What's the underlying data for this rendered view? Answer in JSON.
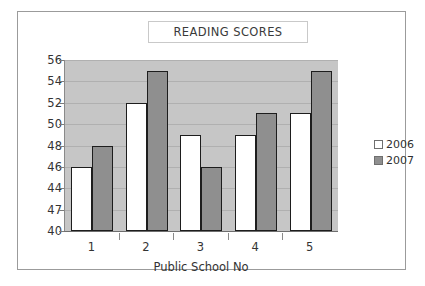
{
  "chart_data": {
    "type": "bar",
    "title": "READING SCORES",
    "xlabel": "Public School No",
    "ylabel": "",
    "categories": [
      "1",
      "2",
      "3",
      "4",
      "5"
    ],
    "series": [
      {
        "name": "2006",
        "values": [
          46,
          52,
          49,
          49,
          51
        ],
        "color": "#ffffff"
      },
      {
        "name": "2007",
        "values": [
          48,
          55,
          46,
          51,
          55
        ],
        "color": "#8f8f8f"
      }
    ],
    "ylim": [
      40,
      56
    ],
    "ytick_step": 2,
    "ytick_values": [
      40,
      42,
      44,
      46,
      48,
      50,
      52,
      54,
      56
    ],
    "ytick_labels": [
      "40",
      "47",
      "44",
      "46",
      "48",
      "50",
      "52",
      "54",
      "56"
    ],
    "grid": true,
    "legend_position": "right",
    "plot_background": "#c6c6c6",
    "gridline_color": "#b0b0b0",
    "bar_outline_color": "#1d1d1d"
  },
  "legend": {
    "items": [
      {
        "label": "2006"
      },
      {
        "label": "2007"
      }
    ]
  }
}
